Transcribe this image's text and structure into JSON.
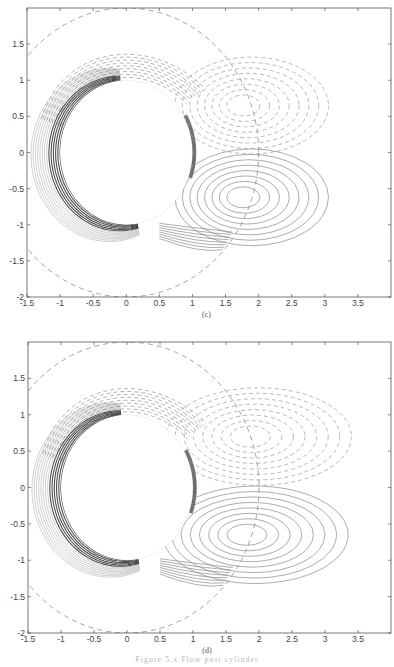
{
  "figure": {
    "caption": "Figure 5.x  Flow past cylinder",
    "panels": [
      {
        "id": "c",
        "label": "(c)"
      },
      {
        "id": "d",
        "label": "(d)"
      }
    ]
  },
  "chart_data": [
    {
      "type": "contour",
      "title": "",
      "panel_label": "(c)",
      "xlabel": "",
      "ylabel": "",
      "xlim": [
        -1.5,
        4.0
      ],
      "ylim": [
        -2.0,
        2.0
      ],
      "x_ticks": [
        "-1.5",
        "-1",
        "-0.5",
        "0",
        "0.5",
        "1",
        "1.5",
        "2",
        "2.5",
        "3",
        "3.5"
      ],
      "y_ticks": [
        "1.5",
        "1",
        "0.5",
        "0",
        "-0.5",
        "-1",
        "-1.5",
        "-2"
      ],
      "grid": false,
      "elements": {
        "cylinder": {
          "center": [
            0,
            0
          ],
          "radius": 1.0
        },
        "outer_dashed_circle": {
          "center": [
            0,
            0
          ],
          "radius": 2.0
        },
        "upper_vortex": {
          "center": [
            1.75,
            0.65
          ],
          "line_style": "dashed",
          "sign": "negative",
          "extent_x": [
            1.0,
            2.9
          ]
        },
        "lower_vortex": {
          "center": [
            1.75,
            -0.62
          ],
          "line_style": "solid",
          "sign": "positive",
          "extent_x": [
            1.0,
            2.9
          ]
        },
        "boundary_layer_shading": "dense contours hugging cylinder surface, concentrated on left/lower side"
      }
    },
    {
      "type": "contour",
      "title": "",
      "panel_label": "(d)",
      "xlabel": "",
      "ylabel": "",
      "xlim": [
        -1.5,
        4.0
      ],
      "ylim": [
        -2.0,
        2.0
      ],
      "x_ticks": [
        "-1.5",
        "-1",
        "-0.5",
        "0",
        "0.5",
        "1",
        "1.5",
        "2",
        "2.5",
        "3",
        "3.5"
      ],
      "y_ticks": [
        "1.5",
        "1",
        "0.5",
        "0",
        "-0.5",
        "-1",
        "-1.5",
        "-2"
      ],
      "grid": false,
      "elements": {
        "cylinder": {
          "center": [
            0,
            0
          ],
          "radius": 1.0
        },
        "outer_dashed_circle": {
          "center": [
            0,
            0
          ],
          "radius": 2.0
        },
        "upper_vortex": {
          "center": [
            1.85,
            0.7
          ],
          "line_style": "dashed",
          "sign": "negative",
          "extent_x": [
            1.0,
            3.3
          ]
        },
        "lower_vortex": {
          "center": [
            1.8,
            -0.65
          ],
          "line_style": "solid",
          "sign": "positive",
          "extent_x": [
            1.0,
            3.3
          ]
        },
        "boundary_layer_shading": "dense contours hugging cylinder surface, concentrated on left/lower side"
      }
    }
  ]
}
